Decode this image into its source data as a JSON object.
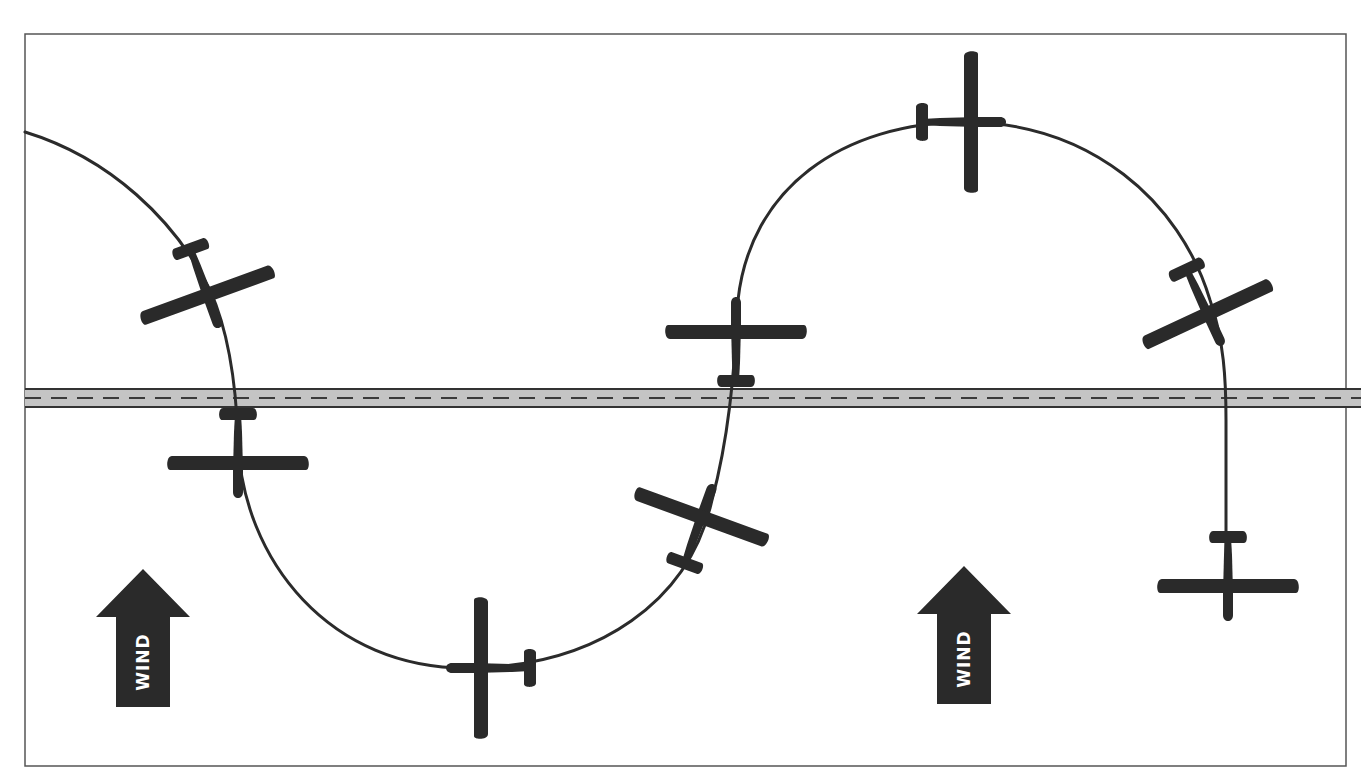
{
  "diagram": {
    "colors": {
      "background": "#ffffff",
      "frame": "#555555",
      "road_fill": "#c4c4c4",
      "road_edge": "#333333",
      "road_centerline": "#3a3a3a",
      "path": "#2b2b2b",
      "aircraft": "#2a2a2a",
      "wind_arrow": "#2a2a2a",
      "wind_text": "#ffffff"
    },
    "frame": {
      "x": 25,
      "y": 34,
      "width": 1321,
      "height": 732
    },
    "road": {
      "y_top": 389,
      "y_bottom": 407,
      "centerline_y": 398,
      "dash": "16,10"
    },
    "wind_arrows": [
      {
        "id": "wind-left",
        "label": "WIND",
        "cx": 143,
        "top": 569,
        "bottom": 707
      },
      {
        "id": "wind-right",
        "label": "WIND",
        "cx": 964,
        "top": 566,
        "bottom": 704
      }
    ],
    "aircraft": [
      {
        "id": "plane-1",
        "x": 207,
        "y": 294,
        "heading": 160,
        "label": "left descending turn"
      },
      {
        "id": "plane-2",
        "x": 238,
        "y": 462,
        "heading": 180,
        "label": "crossing road heading south"
      },
      {
        "id": "plane-3",
        "x": 482,
        "y": 668,
        "heading": 270,
        "label": "bottom of turn heading west"
      },
      {
        "id": "plane-4",
        "x": 701,
        "y": 518,
        "heading": 20,
        "label": "climbing right turn"
      },
      {
        "id": "plane-5",
        "x": 736,
        "y": 333,
        "heading": 0,
        "label": "crossing road heading north"
      },
      {
        "id": "plane-6",
        "x": 970,
        "y": 122,
        "heading": 90,
        "label": "top of turn heading east"
      },
      {
        "id": "plane-7",
        "x": 1207,
        "y": 313,
        "heading": 155,
        "label": "descending right turn"
      },
      {
        "id": "plane-8",
        "x": 1228,
        "y": 585,
        "heading": 180,
        "label": "rolled out heading south"
      }
    ],
    "path_d": "M 25 132 C 110 158 175 220 210 290 C 228 330 236 380 238 440 C 242 560 330 670 470 668 C 600 666 690 600 712 500 C 728 440 734 380 738 300 C 750 190 840 122 968 122 C 1090 124 1180 200 1210 300 C 1224 340 1226 380 1226 420 L 1226 560"
  }
}
